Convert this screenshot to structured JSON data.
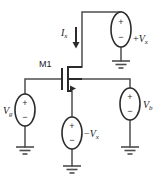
{
  "figure": {
    "name": "mosfet-small-signal-test-circuit",
    "background_color": "#ffffff",
    "wire_color": "#4d4d4d",
    "device_color": "#2b2b2b",
    "width": 163,
    "height": 183
  },
  "transistor": {
    "label": "M1",
    "type": "nmos",
    "terminals": [
      "drain",
      "gate",
      "source",
      "body"
    ]
  },
  "current": {
    "label_symbol": "I",
    "label_subscript": "x",
    "direction": "down",
    "arrow_glyph": "down-arrow"
  },
  "sources": [
    {
      "id": "vx-top",
      "name": "top-voltage-source",
      "label_sign": "+",
      "label_symbol": "V",
      "label_subscript": "x",
      "plus_terminal": "+",
      "minus_terminal": "−",
      "plus_position": "top",
      "minus_position": "bottom",
      "label_side": "right"
    },
    {
      "id": "vg-left",
      "name": "gate-voltage-source",
      "label_sign": "",
      "label_symbol": "V",
      "label_subscript": "g",
      "plus_terminal": "+",
      "minus_terminal": "−",
      "plus_position": "top",
      "minus_position": "bottom",
      "label_side": "left"
    },
    {
      "id": "vx-bottom",
      "name": "source-voltage-source",
      "label_sign": "−",
      "label_symbol": "V",
      "label_subscript": "x",
      "plus_terminal": "+",
      "minus_terminal": "−",
      "plus_position": "top",
      "minus_position": "bottom",
      "label_side": "right"
    },
    {
      "id": "vb-right",
      "name": "body-bias-voltage-source",
      "label_sign": "",
      "label_symbol": "V",
      "label_subscript": "b",
      "plus_terminal": "+",
      "minus_terminal": "−",
      "plus_position": "top",
      "minus_position": "bottom",
      "label_side": "right"
    }
  ],
  "grounds": [
    {
      "id": "gnd-top-right",
      "name": "ground-symbol-top-right"
    },
    {
      "id": "gnd-left",
      "name": "ground-symbol-left"
    },
    {
      "id": "gnd-center",
      "name": "ground-symbol-center"
    },
    {
      "id": "gnd-right",
      "name": "ground-symbol-right"
    }
  ]
}
